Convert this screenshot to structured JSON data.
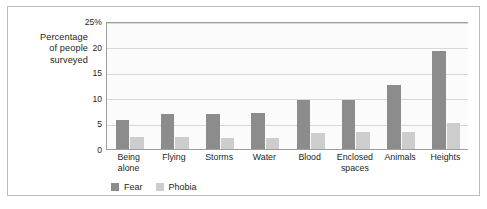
{
  "chart_data": {
    "type": "bar",
    "title": "",
    "xlabel": "",
    "ylabel": "Percentage of people surveyed",
    "ylim": [
      0,
      25
    ],
    "yticks": [
      0,
      5,
      10,
      15,
      20,
      25
    ],
    "ytick_labels": [
      "0",
      "5",
      "10",
      "15",
      "20",
      "25%"
    ],
    "grid": true,
    "legend_position": "bottom-left",
    "categories": [
      "Being alone",
      "Flying",
      "Storms",
      "Water",
      "Blood",
      "Enclosed spaces",
      "Animals",
      "Heights"
    ],
    "series": [
      {
        "name": "Fear",
        "color": "#8c8c8c",
        "values": [
          5.6,
          6.8,
          6.9,
          7.1,
          9.5,
          9.5,
          12.5,
          19.1
        ]
      },
      {
        "name": "Phobia",
        "color": "#cdcdcd",
        "values": [
          2.4,
          2.4,
          2.1,
          2.2,
          3.2,
          3.3,
          3.3,
          5.0
        ]
      }
    ]
  },
  "axis": {
    "title_lines": [
      "Percentage",
      "of people",
      "surveyed"
    ]
  },
  "colors": {
    "fear": "#8c8c8c",
    "phobia": "#cdcdcd",
    "frame_border": "#b9bcc0",
    "axis_line": "#9b9ea1",
    "gridline": "#d6d8da",
    "plot_background": "#fbfbfb",
    "text": "#231f20"
  }
}
